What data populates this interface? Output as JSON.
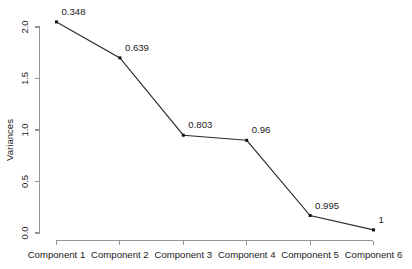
{
  "chart_data": {
    "type": "line",
    "title": "",
    "subtitle": "",
    "xlabel": "",
    "ylabel": "Variances",
    "categories": [
      "Component 1",
      "Component 2",
      "Component 3",
      "Component 4",
      "Component 5",
      "Component 6"
    ],
    "values": [
      2.05,
      1.7,
      0.95,
      0.9,
      0.17,
      0.03
    ],
    "point_labels": [
      "0.348",
      "0.639",
      "0.803",
      "0.96",
      "0.995",
      "1"
    ],
    "ylim": [
      0.0,
      2.15
    ],
    "y_ticks": [
      "0.0",
      "0.5",
      "1.0",
      "1.5",
      "2.0"
    ],
    "y_tick_values": [
      0.0,
      0.5,
      1.0,
      1.5,
      2.0
    ],
    "grid": false,
    "legend": "none",
    "marker": "filled-square",
    "line_color": "#2b2b2b",
    "marker_color": "#111111",
    "axis_color": "#949494",
    "text_color": "#1b1b1b",
    "background": "#ffffff"
  },
  "axes": {
    "y_axis_name": "variances-axis",
    "x_axis_name": "component-axis"
  }
}
